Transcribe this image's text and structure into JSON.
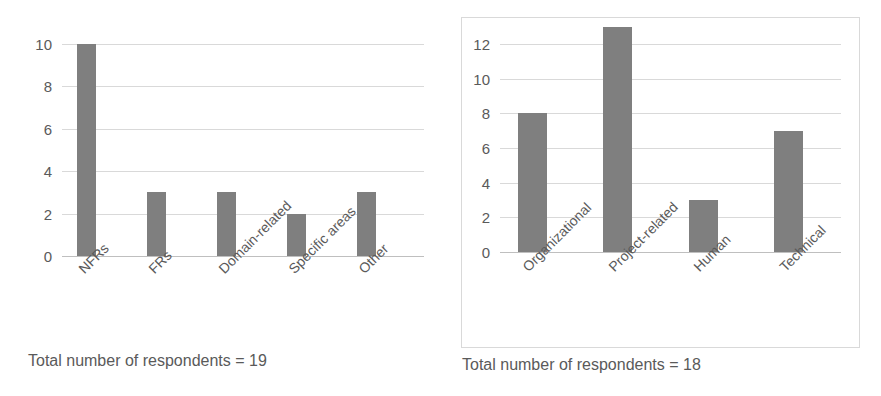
{
  "charts": [
    {
      "id": "chart-left",
      "caption": "Total number of respondents = 19",
      "yticks": [
        "0",
        "2",
        "4",
        "6",
        "8",
        "10"
      ],
      "categories": [
        "NFRs",
        "FRs",
        "Domain-related",
        "Specific areas",
        "Other"
      ],
      "values_text": [
        "10",
        "3",
        "3",
        "2",
        "3"
      ],
      "frame": "none"
    },
    {
      "id": "chart-right",
      "caption": "Total number of respondents = 18",
      "yticks": [
        "0",
        "2",
        "4",
        "6",
        "8",
        "10",
        "12"
      ],
      "categories": [
        "Organizational",
        "Project-related",
        "Human",
        "Technical"
      ],
      "values_text": [
        "8",
        "13",
        "3",
        "7"
      ],
      "frame": "box"
    }
  ],
  "colors": {
    "bar_fill": "#7f7f7f",
    "gridline": "#d9d9d9",
    "baseline": "#bfbfbf",
    "text": "#5a5a5a",
    "frame_border": "#d9d9d9",
    "background": "#ffffff"
  },
  "chart_data": [
    {
      "type": "bar",
      "title": "",
      "subtitle": "",
      "xlabel": "",
      "ylabel": "",
      "categories": [
        "NFRs",
        "FRs",
        "Domain-related",
        "Specific areas",
        "Other"
      ],
      "values": [
        10,
        3,
        3,
        2,
        3
      ],
      "ylim": [
        0,
        10
      ],
      "yticks": [
        0,
        2,
        4,
        6,
        8,
        10
      ],
      "grid": true,
      "legend": "none",
      "annotation": "Total number of respondents = 19",
      "bar_color": "#7f7f7f",
      "xtick_rotation": -45
    },
    {
      "type": "bar",
      "title": "",
      "subtitle": "",
      "xlabel": "",
      "ylabel": "",
      "categories": [
        "Organizational",
        "Project-related",
        "Human",
        "Technical"
      ],
      "values": [
        8,
        13,
        3,
        7
      ],
      "ylim": [
        0,
        13
      ],
      "yticks": [
        0,
        2,
        4,
        6,
        8,
        10,
        12
      ],
      "grid": true,
      "legend": "none",
      "annotation": "Total number of respondents = 18",
      "bar_color": "#7f7f7f",
      "xtick_rotation": -45
    }
  ]
}
